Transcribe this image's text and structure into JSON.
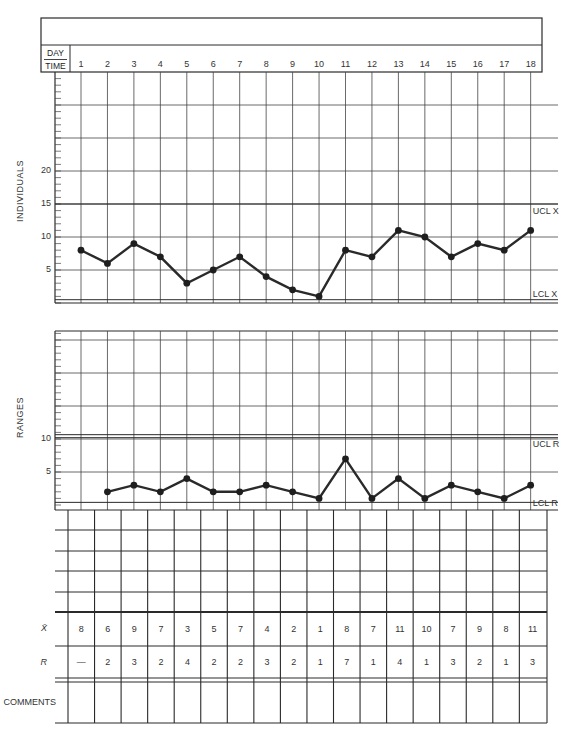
{
  "header": {
    "title": "",
    "day_label": "DAY",
    "time_label": "TIME",
    "days": [
      "1",
      "2",
      "3",
      "4",
      "5",
      "6",
      "7",
      "8",
      "9",
      "10",
      "11",
      "12",
      "13",
      "14",
      "15",
      "16",
      "17",
      "18"
    ]
  },
  "individuals": {
    "axis_label": "INDIVIDUALS",
    "ticks": [
      {
        "v": 5,
        "t": "5"
      },
      {
        "v": 10,
        "t": "10"
      },
      {
        "v": 15,
        "t": "15"
      },
      {
        "v": 20,
        "t": "20"
      }
    ],
    "ucl_label": "UCL X",
    "lcl_label": "LCL X"
  },
  "ranges": {
    "axis_label": "RANGES",
    "ticks": [
      {
        "v": 5,
        "t": "5"
      },
      {
        "v": 10,
        "t": "10"
      }
    ],
    "ucl_label": "UCL R",
    "lcl_label": "LCL R"
  },
  "table": {
    "xbar_label": "X̄",
    "r_label": "R",
    "comments_label": "COMMENTS",
    "xbar_values": [
      "8",
      "6",
      "9",
      "7",
      "3",
      "5",
      "7",
      "4",
      "2",
      "1",
      "8",
      "7",
      "11",
      "10",
      "7",
      "9",
      "8",
      "11"
    ],
    "r_values": [
      "—",
      "2",
      "3",
      "2",
      "4",
      "2",
      "2",
      "3",
      "2",
      "1",
      "7",
      "1",
      "4",
      "1",
      "3",
      "2",
      "1",
      "3"
    ]
  },
  "colors": {
    "line": "#2a2a2a",
    "grid": "#444444",
    "point": "#1e1e1e"
  },
  "chart_data": [
    {
      "type": "line",
      "title": "Individuals",
      "xlabel": "DAY / TIME",
      "ylabel": "INDIVIDUALS",
      "x": [
        1,
        2,
        3,
        4,
        5,
        6,
        7,
        8,
        9,
        10,
        11,
        12,
        13,
        14,
        15,
        16,
        17,
        18
      ],
      "values": [
        8,
        6,
        9,
        7,
        3,
        5,
        7,
        4,
        2,
        1,
        8,
        7,
        11,
        10,
        7,
        9,
        8,
        11
      ],
      "ylim": [
        0,
        35
      ],
      "yticks": [
        5,
        10,
        15,
        20
      ],
      "ucl": 15,
      "lcl": 0.5,
      "annotations": [
        "UCL X",
        "LCL X"
      ],
      "grid": true
    },
    {
      "type": "line",
      "title": "Ranges",
      "xlabel": "DAY / TIME",
      "ylabel": "RANGES",
      "x": [
        2,
        3,
        4,
        5,
        6,
        7,
        8,
        9,
        10,
        11,
        12,
        13,
        14,
        15,
        16,
        17,
        18
      ],
      "values": [
        2,
        3,
        2,
        4,
        2,
        2,
        3,
        2,
        1,
        7,
        1,
        4,
        1,
        3,
        2,
        1,
        3
      ],
      "ylim": [
        0,
        26
      ],
      "yticks": [
        5,
        10
      ],
      "ucl": 10.2,
      "lcl": 0.4,
      "annotations": [
        "UCL R",
        "LCL R"
      ],
      "grid": true
    }
  ]
}
